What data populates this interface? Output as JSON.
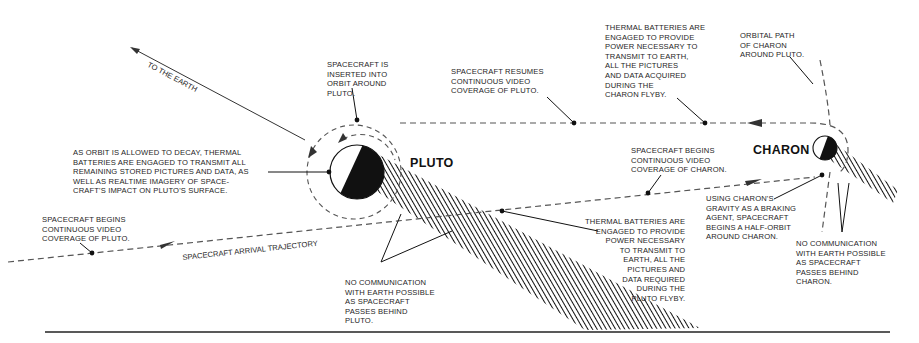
{
  "diagram": {
    "colors": {
      "ink": "#111111",
      "dash": "#555555",
      "background": "#ffffff"
    },
    "bodies": {
      "pluto": {
        "name": "PLUTO"
      },
      "charon": {
        "name": "CHARON"
      }
    },
    "paths": {
      "to_earth": "TO THE EARTH",
      "arrival_trajectory": "SPACECRAFT ARRIVAL TRAJECTORY"
    },
    "annotations": {
      "begins_video_pluto": "SPACECRAFT BEGINS\nCONTINUOUS VIDEO\nCOVERAGE OF PLUTO.",
      "orbit_decay": "AS ORBIT IS ALLOWED TO DECAY, THERMAL\nBATTERIES ARE ENGAGED TO TRANSMIT ALL\nREMAINING STORED PICTURES AND DATA, AS\nWELL AS REALTIME IMAGERY OF SPACE-\nCRAFT'S IMPACT ON PLUTO'S SURFACE.",
      "inserted_orbit": "SPACECRAFT IS\nINSERTED INTO\nORBIT AROUND\nPLUTO.",
      "resumes_video_pluto": "SPACECRAFT RESUMES\nCONTINUOUS VIDEO\nCOVERAGE OF PLUTO.",
      "thermal_charon_flyby": "THERMAL BATTERIES ARE\nENGAGED TO PROVIDE\nPOWER NECESSARY TO\nTRANSMIT TO EARTH,\nALL THE PICTURES\nAND DATA ACQUIRED\nDURING THE\nCHARON FLYBY.",
      "charon_orbital_path": "ORBITAL PATH\nOF CHARON\nAROUND PLUTO.",
      "begins_video_charon": "SPACECRAFT BEGINS\nCONTINUOUS VIDEO\nCOVERAGE OF CHARON.",
      "charon_braking": "USING CHARON'S\nGRAVITY AS A BRAKING\nAGENT, SPACECRAFT\nBEGINS A HALF-ORBIT\nAROUND CHARON.",
      "thermal_pluto_flyby": "THERMAL BATTERIES ARE\nENGAGED TO PROVIDE\nPOWER NECESSARY\nTO TRANSMIT TO\nEARTH, ALL THE\nPICTURES AND\nDATA REQUIRED\nDURING THE\nPLUTO FLYBY.",
      "no_comm_pluto": "NO COMMUNICATION\nWITH EARTH POSSIBLE\nAS SPACECRAFT\nPASSES BEHIND\nPLUTO.",
      "no_comm_charon": "NO COMMUNICATION\nWITH EARTH POSSIBLE\nAS SPACECRAFT\nPASSES BEHIND\nCHARON."
    }
  }
}
